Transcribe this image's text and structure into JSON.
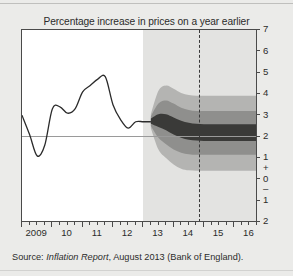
{
  "figure": {
    "title": "Percentage increase in prices on a year earlier",
    "source_prefix": "Source: ",
    "source_italic": "Inflation Report",
    "source_suffix": ", August 2013 (Bank of England).",
    "background_color": "#ebebe9",
    "plot_background_color": "#ffffff",
    "forecast_background_color": "#e3e3e1"
  },
  "chart_data": {
    "type": "area",
    "title": "Percentage increase in prices on a year earlier",
    "xlabel": "",
    "ylabel": "",
    "grid": false,
    "legend": null,
    "xlim": [
      2009.0,
      2016.75
    ],
    "ylim": [
      -2,
      7
    ],
    "y_ticks": [
      7,
      6,
      5,
      4,
      3,
      2,
      1,
      0,
      -1,
      -2
    ],
    "y_tick_labels": [
      "7",
      "6",
      "5",
      "4",
      "3",
      "2",
      "1",
      "0",
      "1",
      "2"
    ],
    "y_sign_plus": "+",
    "y_sign_minus": "–",
    "x_ticks": [
      2009,
      2010,
      2011,
      2012,
      2013,
      2014,
      2015,
      2016
    ],
    "x_tick_labels": [
      "2009",
      "10",
      "11",
      "12",
      "13",
      "14",
      "15",
      "16"
    ],
    "x_minor_interval_quarters": 1,
    "target_line_value": 2,
    "target_line_color": "#9a9a9a",
    "forecast_start_x": 2013.0,
    "marker_line_x": 2014.85,
    "marker_line_style": "dashed",
    "marker_line_color": "#3a3a3a",
    "history_line_color": "#2b2b2b",
    "band_colors": [
      "#b4b4b2",
      "#8f8f8d",
      "#3a3a38"
    ],
    "band_labels": [
      "outer-90pct",
      "middle-60pct",
      "inner-30pct"
    ],
    "series": [
      {
        "name": "CPI inflation (history)",
        "type": "line",
        "x": [
          2009.0,
          2009.25,
          2009.5,
          2009.75,
          2010.0,
          2010.25,
          2010.5,
          2010.75,
          2011.0,
          2011.25,
          2011.5,
          2011.75,
          2012.0,
          2012.25,
          2012.5,
          2012.75,
          2013.0,
          2013.25
        ],
        "values": [
          3.0,
          2.1,
          1.1,
          1.6,
          3.3,
          3.4,
          3.1,
          3.3,
          4.1,
          4.4,
          4.7,
          4.8,
          3.5,
          2.8,
          2.4,
          2.7,
          2.7,
          2.7
        ]
      },
      {
        "name": "Forecast central band (inner 30%)",
        "type": "band",
        "x": [
          2013.25,
          2013.5,
          2013.75,
          2014.0,
          2014.25,
          2014.5,
          2014.75,
          2015.0,
          2015.25,
          2015.5,
          2015.75,
          2016.0,
          2016.25,
          2016.5,
          2016.75
        ],
        "upper": [
          2.85,
          3.05,
          3.05,
          2.9,
          2.75,
          2.65,
          2.6,
          2.58,
          2.58,
          2.58,
          2.58,
          2.58,
          2.58,
          2.58,
          2.58
        ],
        "lower": [
          2.6,
          2.45,
          2.3,
          2.1,
          1.95,
          1.85,
          1.82,
          1.8,
          1.8,
          1.8,
          1.8,
          1.8,
          1.8,
          1.8,
          1.8
        ]
      },
      {
        "name": "Forecast middle band (60%)",
        "type": "band",
        "x": [
          2013.25,
          2013.5,
          2013.75,
          2014.0,
          2014.25,
          2014.5,
          2014.75,
          2015.0,
          2015.25,
          2015.5,
          2015.75,
          2016.0,
          2016.25,
          2016.5,
          2016.75
        ],
        "upper": [
          2.95,
          3.55,
          3.7,
          3.55,
          3.35,
          3.25,
          3.2,
          3.2,
          3.2,
          3.2,
          3.2,
          3.2,
          3.2,
          3.2,
          3.2
        ],
        "lower": [
          2.5,
          1.95,
          1.65,
          1.4,
          1.25,
          1.18,
          1.15,
          1.15,
          1.15,
          1.15,
          1.15,
          1.15,
          1.15,
          1.15,
          1.15
        ]
      },
      {
        "name": "Forecast outer band (90%)",
        "type": "band",
        "x": [
          2013.25,
          2013.5,
          2013.75,
          2014.0,
          2014.25,
          2014.5,
          2014.75,
          2015.0,
          2015.25,
          2015.5,
          2015.75,
          2016.0,
          2016.25,
          2016.5,
          2016.75
        ],
        "upper": [
          3.05,
          4.15,
          4.4,
          4.25,
          4.05,
          3.95,
          3.92,
          3.92,
          3.92,
          3.92,
          3.92,
          3.92,
          3.92,
          3.92,
          3.92
        ],
        "lower": [
          2.4,
          1.4,
          1.0,
          0.7,
          0.5,
          0.42,
          0.4,
          0.4,
          0.4,
          0.4,
          0.4,
          0.4,
          0.4,
          0.4,
          0.4
        ]
      }
    ]
  }
}
